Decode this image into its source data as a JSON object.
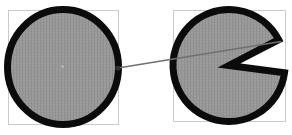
{
  "app": {
    "name": "vector-drawing-canvas"
  },
  "canvas": {
    "width": 292,
    "height": 135,
    "background": "#ffffff",
    "colors": {
      "shape_fill_base": "#9c9c9c",
      "shape_fill_texture": "#8e8e8e",
      "shape_stroke": "#0b0b0b",
      "selection_frame": "#cbcbcb",
      "connector_line": "#707070",
      "connection_marker": "#2f2f2f",
      "center_marker": "#bdbdbd"
    },
    "shapes": [
      {
        "id": "left-circle",
        "type": "ellipse",
        "cx": 63,
        "cy": 67,
        "rx": 55.5,
        "ry": 57.5,
        "stroke_width": 7,
        "frame": {
          "x": 8,
          "y": 10,
          "width": 110,
          "height": 114
        },
        "center_marker": {
          "x": 62.5,
          "y": 66.5,
          "r": 1.2
        }
      },
      {
        "id": "right-pie",
        "type": "pie",
        "cx": 229,
        "cy": 65.5,
        "r": 56,
        "stroke_width": 7,
        "mouth_start_deg": -27.5,
        "mouth_end_deg": 7.5,
        "frame": {
          "x": 173,
          "y": 10,
          "width": 112,
          "height": 111
        }
      }
    ],
    "connector": {
      "x1": 118,
      "y1": 68,
      "x2": 281,
      "y2": 41.5,
      "stroke_width": 1.4,
      "start_marker": {
        "x": 115.5,
        "y": 66,
        "size": 4.5
      }
    }
  }
}
